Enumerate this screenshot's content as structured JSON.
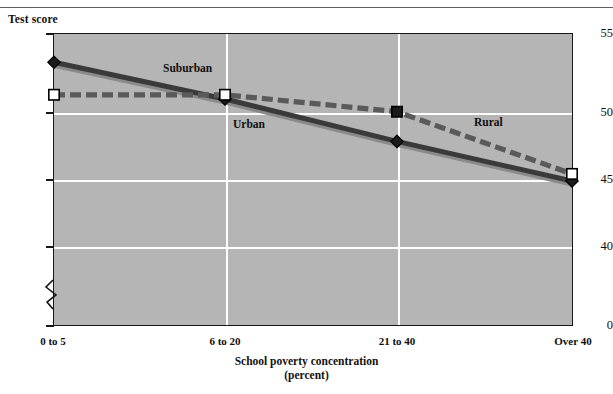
{
  "figure": {
    "y_axis_title": "Test score",
    "x_axis_title_line1": "School poverty concentration",
    "x_axis_title_line2": "(percent)"
  },
  "axes": {
    "y_ticks": [
      "55",
      "50",
      "45",
      "40",
      "0"
    ],
    "x_ticks": [
      "0 to 5",
      "6 to 20",
      "21 to 40",
      "Over 40"
    ],
    "y_break_between": [
      "40",
      "0"
    ]
  },
  "series_labels": {
    "suburban": "Suburban",
    "urban": "Urban",
    "rural": "Rural"
  },
  "colors": {
    "plot_background": "#b5b5b5",
    "gridline": "#ffffff",
    "frame": "#17171a",
    "urban_line": "#3a3a3a",
    "suburban_line": "#8a8a8a",
    "rural_line": "#5a5a5a",
    "text": "#100e0c"
  },
  "chart_data": {
    "type": "line",
    "title": "",
    "xlabel": "School poverty concentration (percent)",
    "ylabel": "Test score",
    "categories": [
      "0 to 5",
      "6 to 20",
      "21 to 40",
      "Over 40"
    ],
    "ylim": [
      40,
      55
    ],
    "yticks": [
      40,
      45,
      50,
      55
    ],
    "axis_break": true,
    "grid": "horizontal-and-vertical",
    "legend": "inline-labels",
    "series": [
      {
        "name": "Urban",
        "values": [
          53.0,
          50.4,
          47.4,
          44.6
        ],
        "style": "solid",
        "color": "#3a3a3a",
        "marker": "diamond"
      },
      {
        "name": "Suburban",
        "values": [
          53.0,
          50.4,
          47.4,
          44.6
        ],
        "style": "solid",
        "color": "#8a8a8a",
        "marker": "diamond"
      },
      {
        "name": "Rural",
        "values": [
          50.7,
          50.7,
          49.5,
          45.1
        ],
        "style": "dashed",
        "color": "#5a5a5a",
        "marker": "square"
      }
    ]
  }
}
